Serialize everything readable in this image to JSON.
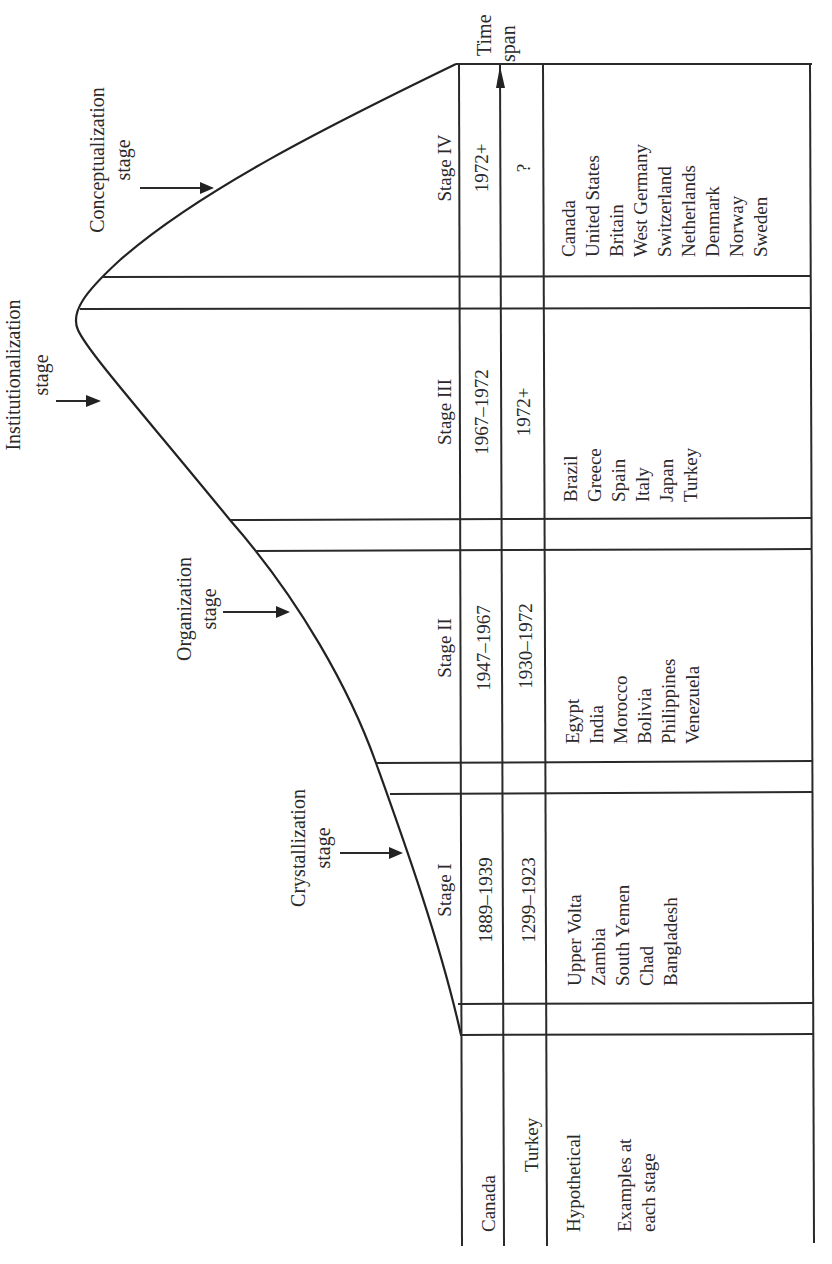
{
  "figure": {
    "orientation": "rotated 90 degrees counter-clockwise",
    "axis_label": "Time span",
    "curve_stages": [
      {
        "label_line1": "Crystallization",
        "label_line2": "stage"
      },
      {
        "label_line1": "Organization",
        "label_line2": "stage"
      },
      {
        "label_line1": "Institutionalization",
        "label_line2": "stage"
      },
      {
        "label_line1": "Conceptualization",
        "label_line2": "stage"
      }
    ],
    "row_headers": {
      "canada": "Canada",
      "turkey": "Turkey",
      "hypothetical": "Hypothetical",
      "examples_line1": "Examples at",
      "examples_line2": "each stage"
    },
    "stages": [
      {
        "name": "Stage I",
        "canada": "1889–1939",
        "turkey": "1299–1923",
        "examples": [
          "Upper Volta",
          "Zambia",
          "South Yemen",
          "Chad",
          "Bangladesh"
        ]
      },
      {
        "name": "Stage II",
        "canada": "1947–1967",
        "turkey": "1930–1972",
        "examples": [
          "Egypt",
          "India",
          "Morocco",
          "Bolivia",
          "Philippines",
          "Venezuela"
        ]
      },
      {
        "name": "Stage III",
        "canada": "1967–1972",
        "turkey": "1972+",
        "examples": [
          "Brazil",
          "Greece",
          "Spain",
          "Italy",
          "Japan",
          "Turkey"
        ]
      },
      {
        "name": "Stage IV",
        "canada": "1972+",
        "turkey": "?",
        "examples": [
          "Canada",
          "United States",
          "Britain",
          "West Germany",
          "Switzerland",
          "Netherlands",
          "Denmark",
          "Norway",
          "Sweden"
        ]
      }
    ]
  }
}
